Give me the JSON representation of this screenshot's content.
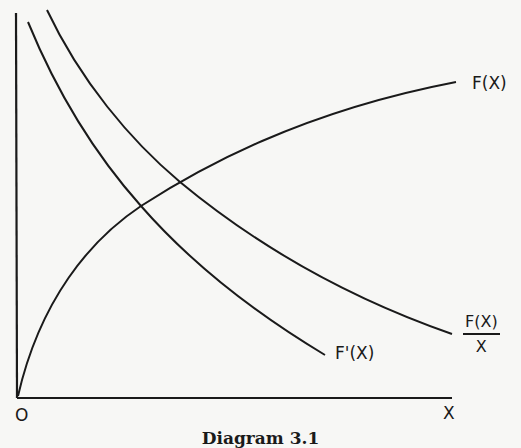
{
  "diagram": {
    "caption": "Diagram 3.1",
    "origin_label": "O",
    "x_axis_label": "X",
    "curves": [
      {
        "id": "F",
        "label": "F(X)",
        "shape": "concave increasing from origin"
      },
      {
        "id": "F_prime",
        "label": "F'(X)",
        "shape": "convex decreasing"
      },
      {
        "id": "F_over_x",
        "label_numerator": "F(X)",
        "label_denominator": "X",
        "shape": "convex decreasing, above F'(X)"
      }
    ],
    "line_color": "#1a1a1a",
    "background_color": "#f7f7f5"
  }
}
